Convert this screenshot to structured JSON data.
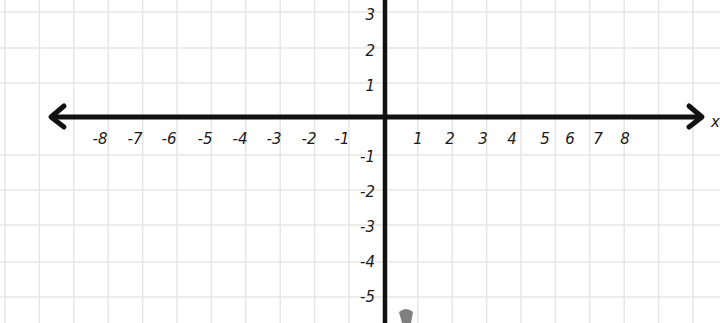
{
  "diagram": {
    "type": "coordinate-plane",
    "x_axis_label": "x",
    "x_ticks": [
      "-8",
      "-7",
      "-6",
      "-5",
      "-4",
      "-3",
      "-2",
      "-1",
      "1",
      "2",
      "3",
      "4",
      "5",
      "6",
      "7",
      "8"
    ],
    "y_ticks_positive": [
      "3",
      "2",
      "1"
    ],
    "y_ticks_negative": [
      "-1",
      "-2",
      "-3",
      "-4",
      "-5"
    ],
    "colors": {
      "axis": "#111111",
      "grid": "#e6e6e6",
      "background": "#ffffff"
    }
  }
}
